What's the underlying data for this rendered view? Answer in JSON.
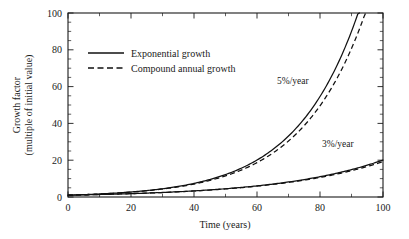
{
  "chart_data": {
    "type": "line",
    "title": "",
    "xlabel": "Time (years)",
    "ylabel": "Growth factor",
    "ylabel_line2": "(multiple of initial value)",
    "xlim": [
      0,
      100
    ],
    "ylim": [
      0,
      100
    ],
    "xticks": [
      0,
      20,
      40,
      60,
      80,
      100
    ],
    "yticks": [
      0,
      20,
      40,
      60,
      80,
      100
    ],
    "xtick_labels": [
      "0",
      "20",
      "40",
      "60",
      "80",
      "100"
    ],
    "ytick_labels": [
      "0",
      "20",
      "40",
      "60",
      "80",
      "100"
    ],
    "x_minor_step": 10,
    "y_minor_step": 5,
    "grid": false,
    "legend_position": "upper-left-inside",
    "series": [
      {
        "name": "Exponential growth",
        "style": "solid",
        "rate_5pct": {
          "label": "5%/year",
          "formula": "exp(0.05*t)",
          "x": [
            0,
            5,
            10,
            15,
            20,
            25,
            30,
            35,
            40,
            45,
            50,
            55,
            60,
            65,
            70,
            75,
            80,
            85,
            90,
            92.1
          ],
          "y": [
            1,
            1.28,
            1.65,
            2.12,
            2.72,
            3.49,
            4.48,
            5.75,
            7.39,
            9.49,
            12.18,
            15.64,
            20.09,
            25.79,
            33.12,
            42.52,
            54.6,
            70.1,
            90.02,
            100.0
          ]
        },
        "rate_3pct": {
          "label": "3%/year",
          "formula": "exp(0.03*t)",
          "x": [
            0,
            10,
            20,
            30,
            40,
            50,
            60,
            70,
            80,
            90,
            100
          ],
          "y": [
            1,
            1.35,
            1.82,
            2.46,
            3.32,
            4.48,
            6.05,
            8.17,
            11.02,
            14.88,
            20.09
          ]
        }
      },
      {
        "name": "Compound annual growth",
        "style": "dashed",
        "rate_5pct": {
          "label": "5%/year",
          "formula": "1.05^t",
          "x": [
            0,
            5,
            10,
            15,
            20,
            25,
            30,
            35,
            40,
            45,
            50,
            55,
            60,
            65,
            70,
            75,
            80,
            85,
            90,
            94.4
          ],
          "y": [
            1,
            1.28,
            1.63,
            2.08,
            2.65,
            3.39,
            4.32,
            5.52,
            7.04,
            8.99,
            11.47,
            14.64,
            18.68,
            23.84,
            30.43,
            38.83,
            49.56,
            63.25,
            80.73,
            100.0
          ]
        },
        "rate_3pct": {
          "label": "3%/year",
          "formula": "1.03^t",
          "x": [
            0,
            10,
            20,
            30,
            40,
            50,
            60,
            70,
            80,
            90,
            100
          ],
          "y": [
            1,
            1.34,
            1.81,
            2.43,
            3.26,
            4.38,
            5.89,
            7.92,
            10.64,
            14.3,
            19.22
          ]
        }
      }
    ],
    "annotations": [
      {
        "text": "5%/year",
        "x_px": 277,
        "y_px": 84
      },
      {
        "text": "3%/year",
        "x_px": 322,
        "y_px": 147
      }
    ],
    "legend": [
      {
        "label": "Exponential growth",
        "style": "solid"
      },
      {
        "label": "Compound annual growth",
        "style": "dashed"
      }
    ]
  }
}
